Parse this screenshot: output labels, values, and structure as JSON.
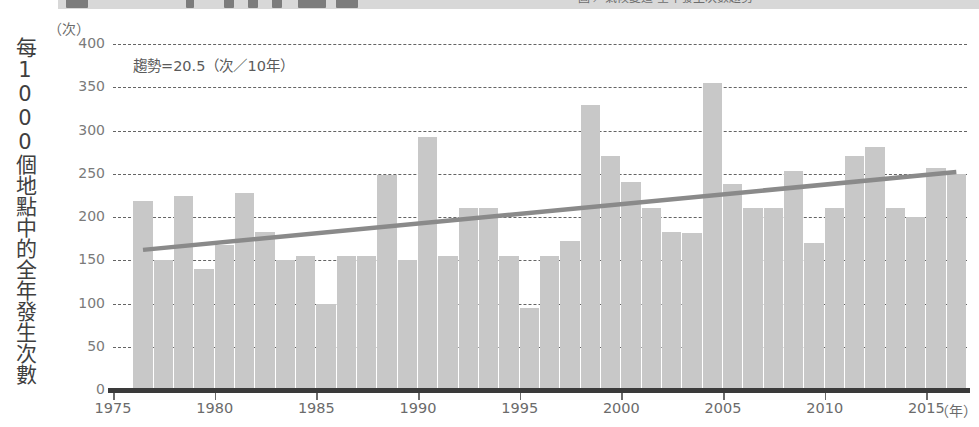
{
  "titlebar": {
    "fragment_text": "圖    ／氣候變遷        全年發生次數趨勢"
  },
  "axis": {
    "y_caption": "每1000個地點中的全年發生次數",
    "y_unit": "（次）",
    "x_unit": "（年）"
  },
  "annotation": "趨勢=20.5（次／10年）",
  "colors": {
    "bar": "#c8c8c8",
    "trend": "#8a8a8a",
    "grid": "#4a4a4a",
    "axis": "#3a3a3a",
    "tick_text": "#7a7a7a"
  },
  "chart_data": {
    "type": "bar",
    "title": "",
    "subtitle": "",
    "xlabel": "（年）",
    "ylabel": "每1000個地點中的全年發生次數（次）",
    "xlim": [
      1975,
      2017
    ],
    "ylim": [
      0,
      400
    ],
    "yticks": [
      0,
      50,
      100,
      150,
      200,
      250,
      300,
      350,
      400
    ],
    "ytick_labels": [
      "0",
      "50",
      "100",
      "150",
      "200",
      "250",
      "300",
      "350",
      "400"
    ],
    "xticks": [
      1975,
      1980,
      1985,
      1990,
      1995,
      2000,
      2005,
      2010,
      2015
    ],
    "xtick_labels": [
      "1975",
      "1980",
      "1985",
      "1990",
      "1995",
      "2000",
      "2005",
      "2010",
      "2015"
    ],
    "grid": "horizontal-dashed",
    "legend": "none",
    "categories": [
      1976,
      1977,
      1978,
      1979,
      1980,
      1981,
      1982,
      1983,
      1984,
      1985,
      1986,
      1987,
      1988,
      1989,
      1990,
      1991,
      1992,
      1993,
      1994,
      1995,
      1996,
      1997,
      1998,
      1999,
      2000,
      2001,
      2002,
      2003,
      2004,
      2005,
      2006,
      2007,
      2008,
      2009,
      2010,
      2011,
      2012,
      2013,
      2014,
      2015,
      2016
    ],
    "values": [
      219,
      150,
      224,
      140,
      168,
      228,
      183,
      150,
      155,
      100,
      155,
      155,
      249,
      150,
      293,
      155,
      210,
      210,
      155,
      95,
      155,
      172,
      330,
      270,
      240,
      210,
      183,
      181,
      355,
      238,
      210,
      210,
      253,
      170,
      210,
      270,
      281,
      210,
      200,
      257,
      250
    ],
    "series": [
      {
        "name": "全年發生次數",
        "type": "bar",
        "values": [
          219,
          150,
          224,
          140,
          168,
          228,
          183,
          150,
          155,
          100,
          155,
          155,
          249,
          150,
          293,
          155,
          210,
          210,
          155,
          95,
          155,
          172,
          330,
          270,
          240,
          210,
          183,
          181,
          355,
          238,
          210,
          210,
          253,
          170,
          210,
          270,
          281,
          210,
          200,
          257,
          250
        ]
      },
      {
        "name": "趨勢線",
        "type": "line",
        "x": [
          1976,
          2016
        ],
        "y": [
          162,
          252
        ],
        "slope_per_decade": 20.5,
        "annotation": "趨勢=20.5（次／10年）"
      }
    ]
  }
}
